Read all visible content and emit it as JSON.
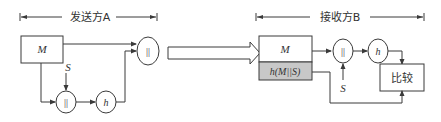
{
  "sender": {
    "header_label": "发送方A",
    "message_box_label": "M",
    "secret_label": "S",
    "concat_symbol": "||",
    "hash_label": "h",
    "output_concat_symbol": "||"
  },
  "transfer": {
    "arrow_icon": "hollow-right-arrow"
  },
  "receiver": {
    "header_label": "接收方B",
    "message_label": "M",
    "hash_field_label": "h(M||S)",
    "concat_symbol": "||",
    "secret_label": "S",
    "hash_label": "h",
    "compare_label": "比较"
  },
  "colors": {
    "line": "#3a3a3a",
    "hash_field_fill": "#c8c8c8",
    "background": "#ffffff"
  }
}
